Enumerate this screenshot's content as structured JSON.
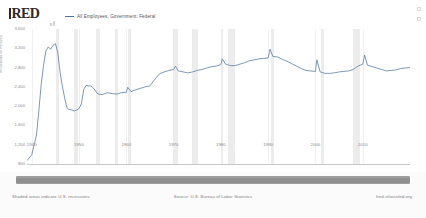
{
  "header": {
    "logo_text": "RED",
    "logo_icon": "fred-bar-icon",
    "sparkline_icon": "sparkline-icon",
    "menu_icon": "menu-grid-icon",
    "legend": [
      {
        "label": "All Employees, Government: Federal",
        "color": "#4572a7"
      }
    ]
  },
  "footer": {
    "left": "Shaded areas indicate U.S. recessions",
    "center": "Source: U.S. Bureau of Labor Statistics",
    "right": "fred.stlouisfed.org"
  },
  "slider": {
    "name": "date-range-slider",
    "start_label": "",
    "end_label": ""
  },
  "chart_data": {
    "type": "line",
    "title": "All Employees, Government: Federal",
    "xlabel": "",
    "ylabel": "Thousands of Persons",
    "grid": true,
    "legend_position": "top-left",
    "line_color": "#4572a7",
    "recession_color": "#ececec",
    "xlim": [
      1939,
      2020
    ],
    "ylim": [
      800,
      3600
    ],
    "yticks": [
      800,
      1200,
      1600,
      2000,
      2400,
      2800,
      3200,
      3600
    ],
    "ytick_labels": [
      "800",
      "1,200",
      "1,600",
      "2,000",
      "2,400",
      "2,800",
      "3,200",
      "3,600"
    ],
    "xticks": [
      1940,
      1950,
      1960,
      1970,
      1980,
      1990,
      2000,
      2010
    ],
    "xtick_labels": [
      "1940",
      "1950",
      "1960",
      "1970",
      "1980",
      "1990",
      "2000",
      "2010"
    ],
    "recessions": [
      [
        1945.1,
        1945.8
      ],
      [
        1948.9,
        1949.8
      ],
      [
        1953.5,
        1954.4
      ],
      [
        1957.6,
        1958.3
      ],
      [
        1960.3,
        1961.1
      ],
      [
        1969.9,
        1970.9
      ],
      [
        1973.9,
        1975.2
      ],
      [
        1980.0,
        1980.5
      ],
      [
        1981.5,
        1982.9
      ],
      [
        1990.5,
        1991.2
      ],
      [
        2001.2,
        2001.9
      ],
      [
        2007.9,
        2009.5
      ]
    ],
    "x": [
      1939,
      1940,
      1941,
      1941.5,
      1942,
      1942.5,
      1943,
      1943.5,
      1944,
      1944.5,
      1945,
      1945.5,
      1946,
      1946.5,
      1947,
      1947.5,
      1948,
      1948.5,
      1949,
      1949.5,
      1950,
      1950.5,
      1951,
      1951.5,
      1952,
      1952.5,
      1953,
      1954,
      1955,
      1956,
      1957,
      1958,
      1959,
      1960,
      1960.3,
      1961,
      1962,
      1963,
      1964,
      1965,
      1966,
      1967,
      1968,
      1969,
      1970,
      1970.4,
      1971,
      1972,
      1973,
      1974,
      1975,
      1976,
      1977,
      1978,
      1979,
      1980,
      1980.3,
      1981,
      1982,
      1983,
      1984,
      1985,
      1986,
      1987,
      1988,
      1989,
      1990,
      1990.4,
      1991,
      1992,
      1993,
      1994,
      1995,
      1996,
      1997,
      1998,
      1999,
      2000,
      2000.3,
      2001,
      2002,
      2003,
      2004,
      2005,
      2006,
      2007,
      2008,
      2009,
      2010,
      2010.4,
      2011,
      2012,
      2013,
      2014,
      2015,
      2016,
      2017,
      2018,
      2019,
      2020
    ],
    "values": [
      870,
      990,
      1400,
      1900,
      2450,
      2850,
      3150,
      3230,
      3180,
      3260,
      3300,
      3120,
      2700,
      2400,
      2150,
      1950,
      1930,
      1920,
      1900,
      1920,
      1950,
      2050,
      2350,
      2430,
      2420,
      2420,
      2380,
      2250,
      2240,
      2280,
      2260,
      2250,
      2280,
      2290,
      2390,
      2300,
      2340,
      2370,
      2400,
      2420,
      2550,
      2670,
      2710,
      2740,
      2760,
      2830,
      2730,
      2710,
      2690,
      2710,
      2740,
      2760,
      2790,
      2820,
      2830,
      2860,
      2980,
      2870,
      2840,
      2840,
      2870,
      2900,
      2940,
      2960,
      2980,
      2990,
      3000,
      3180,
      3030,
      3020,
      2970,
      2930,
      2880,
      2830,
      2780,
      2740,
      2730,
      2720,
      2960,
      2710,
      2680,
      2680,
      2690,
      2710,
      2720,
      2730,
      2760,
      2830,
      2870,
      3060,
      2850,
      2820,
      2790,
      2760,
      2730,
      2740,
      2750,
      2780,
      2790,
      2800
    ]
  }
}
